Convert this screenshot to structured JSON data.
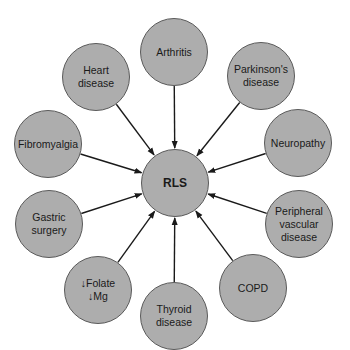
{
  "diagram": {
    "center": {
      "label": "RLS",
      "x": 175,
      "y": 183,
      "r": 34
    },
    "nodes": [
      {
        "id": "arthritis",
        "label": "Arthritis",
        "x": 174,
        "y": 52,
        "r": 34
      },
      {
        "id": "parkinsons",
        "label": "Parkinson's\ndisease",
        "x": 261,
        "y": 76,
        "r": 34
      },
      {
        "id": "neuropathy",
        "label": "Neuropathy",
        "x": 298,
        "y": 143,
        "r": 34
      },
      {
        "id": "peripheral-vascular",
        "label": "Peripheral\nvascular\ndisease",
        "x": 299,
        "y": 224,
        "r": 34
      },
      {
        "id": "copd",
        "label": "COPD",
        "x": 253,
        "y": 288,
        "r": 34
      },
      {
        "id": "thyroid",
        "label": "Thyroid\ndisease",
        "x": 174,
        "y": 316,
        "r": 34
      },
      {
        "id": "folate-mg",
        "label": "↓Folate\n↓Mg",
        "x": 98,
        "y": 290,
        "r": 34
      },
      {
        "id": "gastric-surgery",
        "label": "Gastric\nsurgery",
        "x": 49,
        "y": 224,
        "r": 34
      },
      {
        "id": "fibromyalgia",
        "label": "Fibromyalgia",
        "x": 48,
        "y": 144,
        "r": 34
      },
      {
        "id": "heart-disease",
        "label": "Heart\ndisease",
        "x": 96,
        "y": 77,
        "r": 34
      }
    ],
    "colors": {
      "fill": "#adadad",
      "stroke": "#5a5a5a",
      "arrow": "#1a1a1a"
    }
  }
}
